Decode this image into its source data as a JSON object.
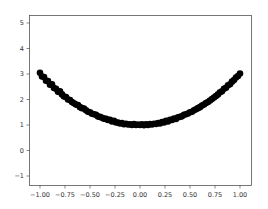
{
  "chart_data": {
    "type": "scatter",
    "title": "",
    "xlabel": "",
    "ylabel": "",
    "xlim": [
      -1.1,
      1.1
    ],
    "ylim": [
      -1.3,
      5.3
    ],
    "grid": false,
    "legend": null,
    "x_ticks": [
      -1.0,
      -0.75,
      -0.5,
      -0.25,
      0.0,
      0.25,
      0.5,
      0.75,
      1.0
    ],
    "x_tick_labels": [
      "−1.00",
      "−0.75",
      "−0.50",
      "−0.25",
      "0.00",
      "0.25",
      "0.50",
      "0.75",
      "1.00"
    ],
    "y_ticks": [
      -1,
      0,
      1,
      2,
      3,
      4,
      5
    ],
    "y_tick_labels": [
      "−1",
      "0",
      "1",
      "2",
      "3",
      "4",
      "5"
    ],
    "marker_color": "#000000",
    "series": [
      {
        "name": "data",
        "description": "Noisy samples of y = 2x^2 + 1",
        "x": [
          -1.0,
          -0.98,
          -0.96,
          -0.94,
          -0.92,
          -0.9,
          -0.88,
          -0.86,
          -0.84,
          -0.82,
          -0.8,
          -0.78,
          -0.76,
          -0.74,
          -0.72,
          -0.7,
          -0.68,
          -0.66,
          -0.64,
          -0.62,
          -0.6,
          -0.58,
          -0.56,
          -0.54,
          -0.52,
          -0.5,
          -0.48,
          -0.46,
          -0.44,
          -0.42,
          -0.4,
          -0.38,
          -0.36,
          -0.34,
          -0.32,
          -0.3,
          -0.28,
          -0.26,
          -0.24,
          -0.22,
          -0.2,
          -0.18,
          -0.16,
          -0.14,
          -0.12,
          -0.1,
          -0.08,
          -0.06,
          -0.04,
          -0.02,
          0.0,
          0.02,
          0.04,
          0.06,
          0.08,
          0.1,
          0.12,
          0.14,
          0.16,
          0.18,
          0.2,
          0.22,
          0.24,
          0.26,
          0.28,
          0.3,
          0.32,
          0.34,
          0.36,
          0.38,
          0.4,
          0.42,
          0.44,
          0.46,
          0.48,
          0.5,
          0.52,
          0.54,
          0.56,
          0.58,
          0.6,
          0.62,
          0.64,
          0.66,
          0.68,
          0.7,
          0.72,
          0.74,
          0.76,
          0.78,
          0.8,
          0.82,
          0.84,
          0.86,
          0.88,
          0.9,
          0.92,
          0.94,
          0.96,
          0.98,
          1.0
        ],
        "y": [
          3.05,
          2.9,
          2.88,
          2.74,
          2.72,
          2.58,
          2.6,
          2.45,
          2.42,
          2.3,
          2.32,
          2.2,
          2.12,
          2.1,
          2.0,
          1.98,
          1.9,
          1.85,
          1.8,
          1.78,
          1.7,
          1.66,
          1.65,
          1.58,
          1.52,
          1.5,
          1.44,
          1.42,
          1.4,
          1.33,
          1.32,
          1.28,
          1.25,
          1.24,
          1.2,
          1.2,
          1.14,
          1.16,
          1.1,
          1.1,
          1.06,
          1.08,
          1.03,
          1.05,
          1.02,
          1.03,
          1.0,
          1.04,
          1.0,
          1.02,
          1.0,
          1.03,
          0.99,
          1.03,
          1.0,
          1.04,
          1.02,
          1.05,
          1.04,
          1.08,
          1.06,
          1.12,
          1.1,
          1.16,
          1.14,
          1.2,
          1.2,
          1.25,
          1.24,
          1.3,
          1.32,
          1.34,
          1.4,
          1.42,
          1.45,
          1.5,
          1.52,
          1.58,
          1.62,
          1.66,
          1.7,
          1.76,
          1.8,
          1.86,
          1.9,
          1.96,
          2.02,
          2.08,
          2.14,
          2.2,
          2.28,
          2.32,
          2.42,
          2.46,
          2.56,
          2.6,
          2.7,
          2.76,
          2.86,
          2.92,
          3.02
        ]
      }
    ]
  }
}
